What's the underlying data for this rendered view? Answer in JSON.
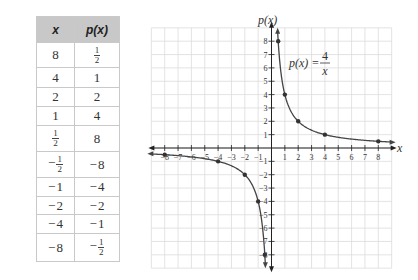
{
  "table": {
    "headers": [
      "x",
      "p(x)"
    ],
    "rows": [
      {
        "x": {
          "sign": "",
          "num": "8",
          "den": ""
        },
        "p": {
          "sign": "",
          "num": "1",
          "den": "2"
        },
        "h": 25
      },
      {
        "x": {
          "sign": "",
          "num": "4",
          "den": ""
        },
        "p": {
          "sign": "",
          "num": "1",
          "den": ""
        },
        "h": 20
      },
      {
        "x": {
          "sign": "",
          "num": "2",
          "den": ""
        },
        "p": {
          "sign": "",
          "num": "2",
          "den": ""
        },
        "h": 19
      },
      {
        "x": {
          "sign": "",
          "num": "1",
          "den": ""
        },
        "p": {
          "sign": "",
          "num": "4",
          "den": ""
        },
        "h": 19
      },
      {
        "x": {
          "sign": "",
          "num": "1",
          "den": "2"
        },
        "p": {
          "sign": "",
          "num": "8",
          "den": ""
        },
        "h": 26
      },
      {
        "x": {
          "sign": "−",
          "num": "1",
          "den": "2"
        },
        "p": {
          "sign": "−",
          "num": "8",
          "den": ""
        },
        "h": 26
      },
      {
        "x": {
          "sign": "−",
          "num": "1",
          "den": ""
        },
        "p": {
          "sign": "−",
          "num": "4",
          "den": ""
        },
        "h": 19
      },
      {
        "x": {
          "sign": "−",
          "num": "2",
          "den": ""
        },
        "p": {
          "sign": "−",
          "num": "2",
          "den": ""
        },
        "h": 18
      },
      {
        "x": {
          "sign": "−",
          "num": "4",
          "den": ""
        },
        "p": {
          "sign": "−",
          "num": "1",
          "den": ""
        },
        "h": 19
      },
      {
        "x": {
          "sign": "−",
          "num": "8",
          "den": ""
        },
        "p": {
          "sign": "−",
          "num": "1",
          "den": "2"
        },
        "h": 28
      }
    ]
  },
  "graph": {
    "ylabel": "p(x)",
    "xlabel": "x",
    "equation": {
      "lhs": "p(x) =",
      "num": "4",
      "den": "x"
    },
    "colors": {
      "grid": "#dcdcdc",
      "axis": "#222222",
      "curve": "#444444",
      "point": "#333333",
      "text": "#333333"
    }
  },
  "chart_data": {
    "type": "line",
    "xlabel": "x",
    "ylabel": "p(x)",
    "xlim": [
      -9,
      9
    ],
    "ylim": [
      -9,
      9
    ],
    "grid": true,
    "x_ticks": [
      -8,
      -7,
      -6,
      -5,
      -4,
      -3,
      -2,
      -1,
      1,
      2,
      3,
      4,
      5,
      6,
      7,
      8
    ],
    "y_ticks": [
      -8,
      -7,
      -6,
      -5,
      -4,
      -3,
      -2,
      -1,
      1,
      2,
      3,
      4,
      5,
      6,
      7,
      8
    ],
    "annotations": [
      "p(x) = 4/x"
    ],
    "series": [
      {
        "name": "p(x) = 4/x (branch x>0)",
        "x": [
          0.5,
          1,
          2,
          4,
          8
        ],
        "y": [
          8,
          4,
          2,
          1,
          0.5
        ]
      },
      {
        "name": "p(x) = 4/x (branch x<0)",
        "x": [
          -0.5,
          -1,
          -2,
          -4,
          -8
        ],
        "y": [
          -8,
          -4,
          -2,
          -1,
          -0.5
        ]
      }
    ]
  }
}
